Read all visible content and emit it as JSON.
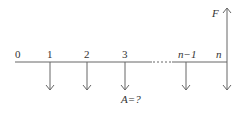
{
  "diagram": {
    "type": "cash-flow-timeline",
    "periods": [
      {
        "label": "0",
        "x": 18,
        "arrow": "none"
      },
      {
        "label": "1",
        "x": 50,
        "arrow": "down"
      },
      {
        "label": "2",
        "x": 87,
        "arrow": "down"
      },
      {
        "label": "3",
        "x": 125,
        "arrow": "down"
      },
      {
        "label": "n−1",
        "x": 186,
        "arrow": "down"
      },
      {
        "label": "n",
        "x": 227,
        "arrow": "both"
      }
    ],
    "future_value_label": "F",
    "annuity_label": "A=?",
    "line_color": "#555555"
  }
}
